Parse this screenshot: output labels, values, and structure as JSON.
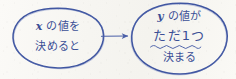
{
  "diagram": {
    "type": "flow-diagram",
    "background_color": "#f7f6f2",
    "ink_color": "#3b4f96",
    "style": "hand-drawn",
    "nodes": [
      {
        "id": "node-x",
        "shape": "ellipse",
        "lines": [
          {
            "var": "x",
            "text": " の値を"
          },
          {
            "var": "",
            "text": "決めると"
          }
        ],
        "line1_var": "x",
        "line1_text": " の値を",
        "line2_text": "決めると"
      },
      {
        "id": "node-y",
        "shape": "ellipse",
        "line1_var": "y",
        "line1_text": " の値が",
        "line2_text": "ただ1つ",
        "line2_emphasis": "wavy-underline",
        "line3_text": "決まる"
      }
    ],
    "edges": [
      {
        "id": "edge-x-to-y",
        "from": "node-x",
        "to": "node-y",
        "arrow": "single",
        "direction": "right"
      }
    ]
  }
}
